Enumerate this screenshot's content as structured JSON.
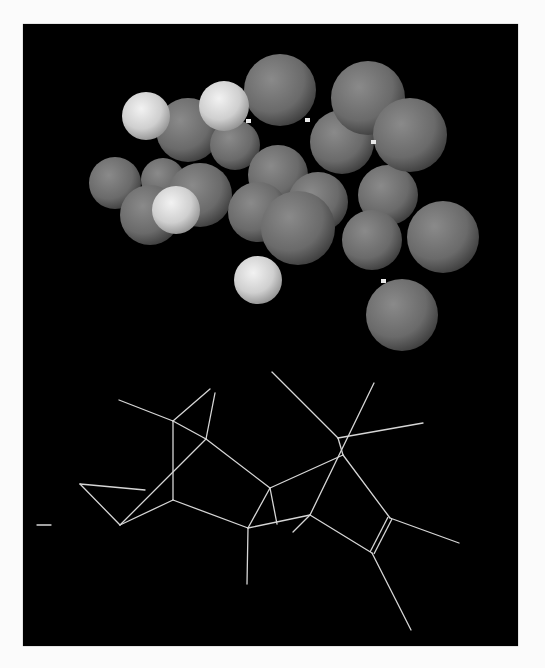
{
  "figure": {
    "background": "#000000",
    "page_background": "#fbfbfb",
    "colors": {
      "carbon_sphere": "#6e6e6e",
      "hydrogen_sphere": "#d8d8d8",
      "wire": "#d6d6d6",
      "bond_stub": "#e8e8e8"
    },
    "space_filling_model": {
      "atoms": [
        {
          "type": "C",
          "cx": 115,
          "cy": 183,
          "r": 26
        },
        {
          "type": "C",
          "cx": 163,
          "cy": 180,
          "r": 22
        },
        {
          "type": "C",
          "cx": 150,
          "cy": 215,
          "r": 30
        },
        {
          "type": "C",
          "cx": 200,
          "cy": 195,
          "r": 32
        },
        {
          "type": "C",
          "cx": 188,
          "cy": 130,
          "r": 32
        },
        {
          "type": "C",
          "cx": 235,
          "cy": 145,
          "r": 25
        },
        {
          "type": "C",
          "cx": 278,
          "cy": 175,
          "r": 30
        },
        {
          "type": "C",
          "cx": 258,
          "cy": 212,
          "r": 30
        },
        {
          "type": "C",
          "cx": 318,
          "cy": 202,
          "r": 30
        },
        {
          "type": "C",
          "cx": 342,
          "cy": 142,
          "r": 32
        },
        {
          "type": "C",
          "cx": 368,
          "cy": 98,
          "r": 37
        },
        {
          "type": "C",
          "cx": 388,
          "cy": 195,
          "r": 30
        },
        {
          "type": "C",
          "cx": 372,
          "cy": 240,
          "r": 30
        },
        {
          "type": "C",
          "cx": 410,
          "cy": 135,
          "r": 37
        },
        {
          "type": "C",
          "cx": 443,
          "cy": 237,
          "r": 36
        },
        {
          "type": "C",
          "cx": 298,
          "cy": 228,
          "r": 37
        },
        {
          "type": "C",
          "cx": 280,
          "cy": 90,
          "r": 36
        },
        {
          "type": "C",
          "cx": 402,
          "cy": 315,
          "r": 36
        },
        {
          "type": "H",
          "cx": 146,
          "cy": 116,
          "r": 24
        },
        {
          "type": "H",
          "cx": 224,
          "cy": 106,
          "r": 25
        },
        {
          "type": "H",
          "cx": 176,
          "cy": 210,
          "r": 24
        },
        {
          "type": "H",
          "cx": 258,
          "cy": 280,
          "r": 24
        }
      ],
      "stubs": [
        {
          "x": 248,
          "y": 121
        },
        {
          "x": 307,
          "y": 120
        },
        {
          "x": 373,
          "y": 142
        },
        {
          "x": 383,
          "y": 281
        }
      ]
    },
    "wireframe_model": {
      "bonds": [
        [
          119,
          400,
          173,
          421
        ],
        [
          173,
          421,
          210,
          389
        ],
        [
          215,
          393,
          206,
          439
        ],
        [
          173,
          421,
          206,
          439
        ],
        [
          173,
          421,
          173,
          500
        ],
        [
          206,
          439,
          120,
          525
        ],
        [
          80,
          484,
          145,
          490
        ],
        [
          80,
          484,
          120,
          525
        ],
        [
          120,
          525,
          173,
          500
        ],
        [
          173,
          500,
          248,
          528
        ],
        [
          206,
          439,
          270,
          488
        ],
        [
          270,
          488,
          248,
          528
        ],
        [
          270,
          488,
          277,
          524
        ],
        [
          248,
          528,
          310,
          515
        ],
        [
          248,
          528,
          247,
          584
        ],
        [
          270,
          488,
          343,
          455
        ],
        [
          272,
          372,
          338,
          438
        ],
        [
          374,
          383,
          310,
          515
        ],
        [
          338,
          438,
          423,
          423
        ],
        [
          338,
          438,
          343,
          455
        ],
        [
          343,
          455,
          390,
          518
        ],
        [
          310,
          515,
          293,
          532
        ],
        [
          310,
          515,
          372,
          553
        ],
        [
          390,
          518,
          459,
          543
        ],
        [
          372,
          553,
          411,
          630
        ],
        [
          37,
          525,
          51,
          525
        ]
      ],
      "double_bonds": [
        [
          390,
          518,
          372,
          553
        ]
      ]
    }
  }
}
